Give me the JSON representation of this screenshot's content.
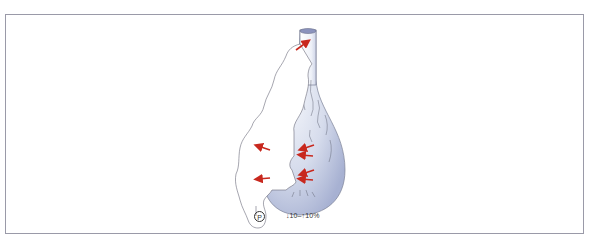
{
  "figure": {
    "labels": {
      "p_marker": "P",
      "percentage": "↓10–↑10%"
    },
    "colors": {
      "arrow": "#c8281e",
      "vessel_fill_light": "#eef1f8",
      "vessel_fill_dark": "#aab3d4",
      "outline": "#6a6a78",
      "frame_border": "#9a9aa8"
    },
    "arrows": {
      "top": 1,
      "inward_right": 4,
      "outward_left": 2
    }
  }
}
